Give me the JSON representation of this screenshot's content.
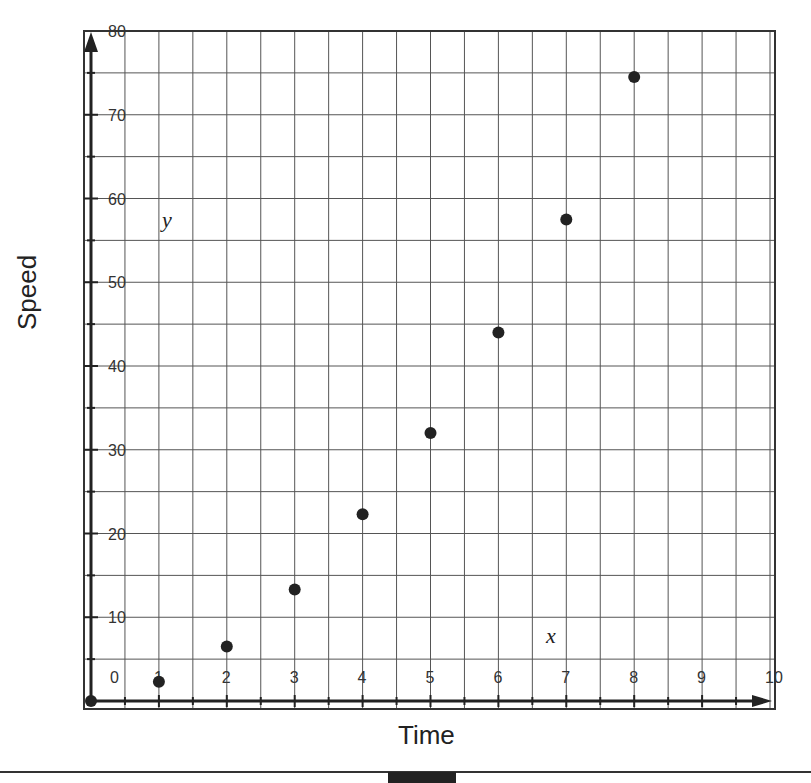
{
  "chart_data": {
    "type": "scatter",
    "title": "",
    "xlabel": "Time",
    "ylabel": "Speed",
    "x_axis_var": "x",
    "y_axis_var": "y",
    "xlim": [
      0,
      10
    ],
    "ylim": [
      0,
      80
    ],
    "x_ticks": [
      0,
      1,
      2,
      3,
      4,
      5,
      6,
      7,
      8,
      9,
      10
    ],
    "y_ticks": [
      10,
      20,
      30,
      40,
      50,
      60,
      70,
      80
    ],
    "grid": true,
    "grid_minor_step_x": 0.5,
    "grid_minor_step_y": 5,
    "series": [
      {
        "name": "points",
        "x": [
          0,
          1,
          2,
          3,
          4,
          5,
          6,
          7,
          8
        ],
        "y": [
          0,
          2.3,
          6.5,
          13.3,
          22.3,
          32,
          44,
          57.5,
          74.5
        ]
      }
    ]
  },
  "labels": {
    "xlabel": "Time",
    "ylabel": "Speed",
    "x_var": "x",
    "y_var": "y",
    "origin": "0"
  }
}
